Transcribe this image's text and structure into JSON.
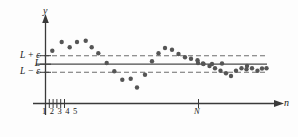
{
  "figure": {
    "title": "",
    "background_color": "#fdfdfd",
    "axis_color": "#3a3a3a",
    "point_color": "#555555",
    "dash_color": "#6e6e6e"
  },
  "axes": {
    "y_axis_label": "y",
    "x_axis_label": "n"
  },
  "levels": {
    "upper_label": "L + ε",
    "mid_label": "L",
    "lower_label": "L − ε"
  },
  "ticks": {
    "start_labels": "1 2 3 4 5",
    "n_label": "N"
  },
  "chart_data": {
    "type": "scatter",
    "title": "",
    "xlabel": "n",
    "ylabel": "y",
    "xlim": [
      0,
      40
    ],
    "ylim": [
      -2.6,
      2.6
    ],
    "grid": false,
    "legend": null,
    "annotations": [
      "L + ε",
      "L",
      "L − ε",
      "N"
    ],
    "reference_lines": [
      {
        "label": "L + ε",
        "y": 1.0,
        "style": "dashed"
      },
      {
        "label": "L",
        "y": 0.0,
        "style": "solid"
      },
      {
        "label": "L − ε",
        "y": -1.0,
        "style": "dashed"
      }
    ],
    "x": [
      1,
      2,
      3,
      4,
      5,
      6,
      7,
      8,
      9,
      10,
      11,
      12,
      13,
      14,
      15,
      16,
      17,
      18,
      19,
      20,
      21,
      22,
      23,
      24,
      25,
      26,
      27,
      28,
      29,
      30,
      31,
      32,
      33,
      34,
      35,
      36,
      37,
      38,
      39
    ],
    "y": [
      1.72,
      2.72,
      2.1,
      2.72,
      2.88,
      2.1,
      1.36,
      0.16,
      -0.86,
      -1.92,
      -1.8,
      -2.88,
      -1.32,
      0.36,
      1.36,
      2.04,
      1.84,
      1.32,
      0.92,
      0.76,
      0.56,
      0.2,
      -0.04,
      0.0,
      -0.24,
      -0.56,
      -0.86,
      -1.16,
      -1.52,
      -0.86,
      -0.56,
      -0.68,
      -0.56,
      -0.68,
      -0.5,
      -0.44,
      -0.4,
      -0.36,
      -0.34
    ],
    "points_px": [
      [
        52.3,
        50.7
      ],
      [
        61.7,
        42.0
      ],
      [
        69.7,
        47.3
      ],
      [
        77.0,
        42.0
      ],
      [
        85.7,
        40.7
      ],
      [
        91.7,
        47.3
      ],
      [
        98.3,
        53.3
      ],
      [
        106.7,
        63.0
      ],
      [
        114.3,
        71.3
      ],
      [
        122.3,
        79.7
      ],
      [
        130.7,
        78.7
      ],
      [
        137.0,
        87.5
      ],
      [
        145.0,
        74.7
      ],
      [
        152.0,
        61.3
      ],
      [
        158.5,
        53.3
      ],
      [
        165.0,
        48.0
      ],
      [
        172.0,
        49.7
      ],
      [
        178.5,
        54.0
      ],
      [
        185.0,
        57.3
      ],
      [
        191.0,
        58.7
      ],
      [
        197.5,
        60.3
      ],
      [
        203.5,
        64.0
      ],
      [
        209.5,
        66.0
      ],
      [
        215.0,
        68.3
      ],
      [
        220.5,
        70.7
      ],
      [
        226.0,
        73.3
      ],
      [
        231.0,
        76.0
      ],
      [
        236.0,
        70.7
      ],
      [
        241.5,
        68.3
      ],
      [
        246.5,
        69.3
      ],
      [
        252.0,
        68.3
      ],
      [
        257.5,
        70.7
      ],
      [
        262.0,
        68.5
      ],
      [
        266.5,
        68.3
      ],
      [
        247.0,
        66.0
      ],
      [
        222.0,
        63.5
      ],
      [
        212.0,
        64.0
      ],
      [
        203.0,
        63.5
      ],
      [
        198.0,
        63.0
      ]
    ]
  }
}
